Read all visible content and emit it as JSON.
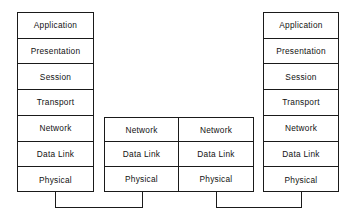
{
  "diagram": {
    "stroke_color": "#1a1a1a",
    "background_color": "#ffffff",
    "left_stack": {
      "name": "End System A",
      "layers": [
        {
          "label": "Application"
        },
        {
          "label": "Presentation"
        },
        {
          "label": "Session"
        },
        {
          "label": "Transport"
        },
        {
          "label": "Network"
        },
        {
          "label": "Data Link"
        },
        {
          "label": "Physical"
        }
      ]
    },
    "relay_node": {
      "name": "Intermediate Node",
      "left_column": {
        "layers": [
          {
            "label": "Network"
          },
          {
            "label": "Data Link"
          },
          {
            "label": "Physical"
          }
        ]
      },
      "right_column": {
        "layers": [
          {
            "label": "Network"
          },
          {
            "label": "Data Link"
          },
          {
            "label": "Physical"
          }
        ]
      }
    },
    "right_stack": {
      "name": "End System B",
      "layers": [
        {
          "label": "Application"
        },
        {
          "label": "Presentation"
        },
        {
          "label": "Session"
        },
        {
          "label": "Transport"
        },
        {
          "label": "Network"
        },
        {
          "label": "Data Link"
        },
        {
          "label": "Physical"
        }
      ]
    },
    "links": [
      {
        "name": "physical-medium-left",
        "label": ""
      },
      {
        "name": "physical-medium-right",
        "label": ""
      }
    ]
  }
}
